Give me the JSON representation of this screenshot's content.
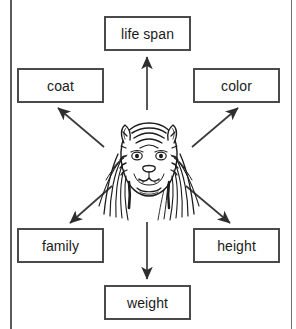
{
  "diagram": {
    "type": "concept-web",
    "center": {
      "icon": "tiger-head-in-grass-illustration",
      "subject": "tiger"
    },
    "colors": {
      "box_border": "#4a4a4a",
      "text": "#1a1a1a",
      "arrow": "#333333",
      "page_rule": "#5b5b5b",
      "background": "#ffffff"
    },
    "nodes": [
      {
        "id": "life-span",
        "label": "life span",
        "position": "top"
      },
      {
        "id": "coat",
        "label": "coat",
        "position": "top-left"
      },
      {
        "id": "color",
        "label": "color",
        "position": "top-right"
      },
      {
        "id": "family",
        "label": "family",
        "position": "bottom-left"
      },
      {
        "id": "height",
        "label": "height",
        "position": "bottom-right"
      },
      {
        "id": "weight",
        "label": "weight",
        "position": "bottom"
      }
    ],
    "arrows": [
      {
        "from": "center",
        "to": "life-span",
        "direction": "up"
      },
      {
        "from": "center",
        "to": "coat",
        "direction": "up-left"
      },
      {
        "from": "center",
        "to": "color",
        "direction": "up-right"
      },
      {
        "from": "center",
        "to": "family",
        "direction": "down-left"
      },
      {
        "from": "center",
        "to": "height",
        "direction": "down-right"
      },
      {
        "from": "center",
        "to": "weight",
        "direction": "down"
      }
    ]
  }
}
